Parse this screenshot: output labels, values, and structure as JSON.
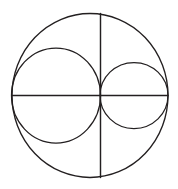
{
  "figure": {
    "background_color": "#ffffff",
    "stroke_color": "#231f20",
    "canvas": {
      "width": 178,
      "height": 189
    },
    "elements": {
      "outer_circle": {
        "name": "outer-circle",
        "cx": 90,
        "cy": 95.5,
        "rx": 78,
        "ry": 82,
        "stroke_width": 1.35
      },
      "horizontal_diameter": {
        "name": "horizontal-diameter",
        "x1": 12,
        "y1": 95.5,
        "x2": 168,
        "y2": 95.5,
        "stroke_width": 1.3
      },
      "vertical_chord": {
        "name": "vertical-chord",
        "x1": 100.5,
        "y1": 13.5,
        "x2": 100.5,
        "y2": 177.5,
        "stroke_width": 1.45
      },
      "left_inner_circle": {
        "name": "left-inner-circle",
        "cx": 56,
        "cy": 95.5,
        "rx": 44.5,
        "ry": 47.5,
        "stroke_width": 1.25
      },
      "right_inner_circle": {
        "name": "right-inner-circle",
        "cx": 134,
        "cy": 95.5,
        "rx": 34,
        "ry": 33,
        "stroke_width": 1.25
      }
    }
  }
}
